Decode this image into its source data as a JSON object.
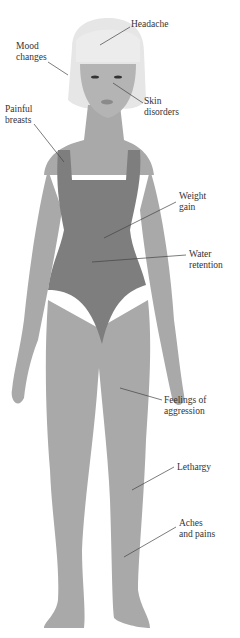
{
  "diagram": {
    "colors": {
      "background": "#ffffff",
      "skin": "#a9a9a9",
      "swimsuit": "#7e7e7e",
      "hair": "#e6e6e6",
      "face": "#b4b4b4",
      "leader_line": "#444444",
      "label_text": "#333333"
    },
    "labels": [
      {
        "id": "headache",
        "text": "Headache"
      },
      {
        "id": "mood",
        "text": "Mood\nchanges"
      },
      {
        "id": "skin",
        "text": "Skin\ndisorders"
      },
      {
        "id": "breasts",
        "text": "Painful\nbreasts"
      },
      {
        "id": "weight",
        "text": "Weight\ngain"
      },
      {
        "id": "water",
        "text": "Water\nretention"
      },
      {
        "id": "aggression",
        "text": "Feelings of\naggression"
      },
      {
        "id": "lethargy",
        "text": "Lethargy"
      },
      {
        "id": "aches",
        "text": "Aches\nand pains"
      }
    ]
  }
}
